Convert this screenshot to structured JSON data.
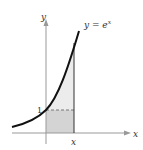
{
  "figure": {
    "curve_label_prefix": "y = e",
    "curve_label_exp": "x",
    "y_axis_label": "y",
    "x_axis_label": "x",
    "x_tick_label": "x",
    "y_tick_label": "1",
    "colors": {
      "curve": "#111111",
      "axis": "#999999",
      "rect": "#d4d4d4",
      "region": "#ececec",
      "dash": "#777777"
    }
  }
}
